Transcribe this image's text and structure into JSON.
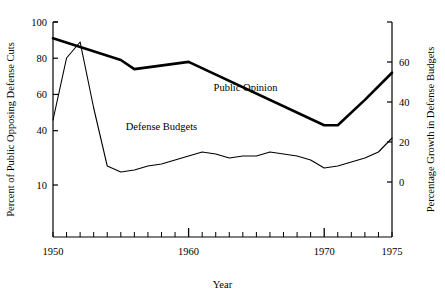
{
  "chart_data": {
    "type": "line",
    "title": "",
    "xlabel": "Year",
    "ylabel_left": "Percent of Public Opposing Defense Cuts",
    "ylabel_right": "Percentage Growth in Defense Budgets",
    "xlim": [
      1950,
      1975
    ],
    "xticks_major": [
      1950,
      1960,
      1970,
      1975
    ],
    "xticks_minor_every": 1,
    "xtick_labels": [
      "1950",
      "1960",
      "1970",
      "1975"
    ],
    "ylim_left": [
      0,
      100
    ],
    "yticks_left": [
      10,
      40,
      60,
      80,
      100
    ],
    "ytick_labels_left": [
      "10",
      "40",
      "60",
      "80",
      "100"
    ],
    "ylim_right": [
      -10,
      80
    ],
    "yticks_right": [
      0,
      20,
      40,
      60,
      80
    ],
    "ytick_labels_right": [
      "0",
      "20",
      "40",
      "60",
      ""
    ],
    "grid": false,
    "legend_position": "inline-annotation",
    "series": [
      {
        "name": "Public Opinion",
        "axis": "left",
        "stroke_width": 2.6,
        "color": "#000000",
        "label_x": 1964.2,
        "label_y": 62,
        "x": [
          1950,
          1955,
          1956,
          1960,
          1970,
          1971,
          1973,
          1975
        ],
        "values": [
          91,
          79,
          74,
          78,
          43,
          43,
          57,
          72
        ]
      },
      {
        "name": "Defense Budgets",
        "axis": "right",
        "stroke_width": 1.1,
        "color": "#000000",
        "label_x": 1958.0,
        "label_y": 26,
        "x": [
          1950,
          1951,
          1952,
          1953,
          1954,
          1955,
          1956,
          1957,
          1958,
          1959,
          1960,
          1961,
          1962,
          1963,
          1964,
          1965,
          1966,
          1967,
          1968,
          1969,
          1970,
          1971,
          1972,
          1973,
          1974,
          1975
        ],
        "values": [
          31,
          62,
          70,
          37,
          8,
          5,
          6,
          8,
          9,
          11,
          13,
          15,
          14,
          12,
          13,
          13,
          15,
          14,
          13,
          11,
          7,
          8,
          10,
          12,
          15,
          22
        ]
      }
    ]
  },
  "annotations": {
    "public_opinion_label": "Public Opinion",
    "defense_budgets_label": "Defense Budgets"
  }
}
